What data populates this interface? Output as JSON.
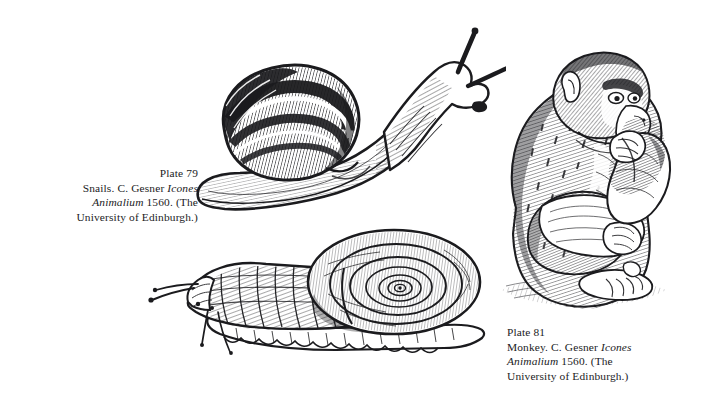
{
  "page": {
    "background_color": "#ffffff",
    "ink_color": "#17171a",
    "kind": "book-plate-page"
  },
  "captions": [
    {
      "id": "snails",
      "align": "right",
      "plate_label": "Plate 79",
      "lines": [
        {
          "segments": [
            {
              "text": "Plate 79",
              "style": "roman"
            }
          ]
        },
        {
          "segments": [
            {
              "text": "Snails. C. Gesner ",
              "style": "roman"
            },
            {
              "text": "Icones",
              "style": "italic"
            }
          ]
        },
        {
          "segments": [
            {
              "text": "Animalium",
              "style": "italic"
            },
            {
              "text": " 1560. (The",
              "style": "roman"
            }
          ]
        },
        {
          "segments": [
            {
              "text": "University of Edinburgh.)",
              "style": "roman"
            }
          ]
        }
      ],
      "plain_text": "Plate 79 Snails. C. Gesner Icones Animalium 1560. (The University of Edinburgh.)"
    },
    {
      "id": "monkey",
      "align": "left",
      "plate_label": "Plate 81",
      "lines": [
        {
          "segments": [
            {
              "text": "Plate 81",
              "style": "roman"
            }
          ]
        },
        {
          "segments": [
            {
              "text": "Monkey. C. Gesner ",
              "style": "roman"
            },
            {
              "text": "Icones",
              "style": "italic"
            }
          ]
        },
        {
          "segments": [
            {
              "text": "Animalium",
              "style": "italic"
            },
            {
              "text": " 1560. (The",
              "style": "roman"
            }
          ]
        },
        {
          "segments": [
            {
              "text": "University of Edinburgh.)",
              "style": "roman"
            }
          ]
        }
      ],
      "plain_text": "Plate 81 Monkey. C. Gesner Icones Animalium 1560. (The University of Edinburgh.)"
    }
  ],
  "figures": [
    {
      "id": "snail-top",
      "name": "snail-with-conical-shell-engraving",
      "description": "Woodcut engraving of a garden snail crawling up-right, tall banded conical shell with dark spiral bands, two thick raised tentacles with knobbed tips, broad foot below.",
      "technique": "woodcut line engraving",
      "subject": "snail"
    },
    {
      "id": "snail-bottom",
      "name": "snail-with-flat-spiral-shell-engraving",
      "description": "Woodcut engraving of a snail with a flat coiled discus shell in profile, head at left with two long thin tentacles and two shorter lower tentacles, ruffled foot margin.",
      "technique": "woodcut line engraving",
      "subject": "snail"
    },
    {
      "id": "monkey",
      "name": "crouching-monkey-engraving",
      "description": "Woodcut engraving of a monkey crouching in profile facing right, one hand raised to its mouth, hunched back, hatched fur, seated on a hatched patch of ground.",
      "technique": "woodcut line engraving",
      "subject": "monkey"
    }
  ]
}
